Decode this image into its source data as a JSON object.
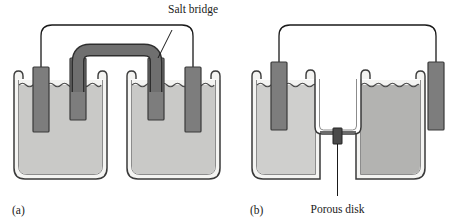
{
  "figure": {
    "title_visible": false,
    "background_color": "#ffffff",
    "panels": [
      {
        "id": "a",
        "label": "(a)",
        "caption_note": "Galvanic cell with salt bridge connecting two separate beakers",
        "annotations": [
          {
            "name": "salt-bridge",
            "text": "Salt bridge"
          }
        ]
      },
      {
        "id": "b",
        "label": "(b)",
        "caption_note": "Galvanic cell with porous disk separating two compartments",
        "annotations": [
          {
            "name": "porous-disk",
            "text": "Porous disk"
          }
        ]
      }
    ],
    "colors": {
      "outline": "#2b2b2b",
      "glass_fill": "#f2f2f0",
      "liquid_light": "#c9c9c7",
      "liquid_medium": "#b3b3b1",
      "liquid_pale": "#cfcfcd",
      "electrode_fill": "#7d7d7d",
      "electrode_stroke": "#3a3a3a",
      "salt_bridge_fill": "#6f6f6f",
      "salt_bridge_stroke": "#2e2e2e",
      "wire": "#1a1a1a",
      "porous_disk": "#4a4a4a",
      "label_text": "#1a1a1a"
    }
  }
}
